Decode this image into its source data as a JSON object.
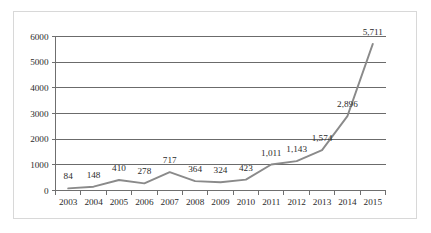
{
  "chart_data": {
    "type": "line",
    "title": "",
    "subtitle": "",
    "xlabel": "",
    "ylabel": "",
    "categories": [
      "2003",
      "2004",
      "2005",
      "2006",
      "2007",
      "2008",
      "2009",
      "2010",
      "2011",
      "2012",
      "2013",
      "2014",
      "2015"
    ],
    "values": [
      84,
      148,
      410,
      278,
      717,
      364,
      324,
      423,
      1011,
      1143,
      1574,
      2896,
      5711
    ],
    "point_labels": [
      "84",
      "148",
      "410",
      "278",
      "717",
      "364",
      "324",
      "423",
      "1,011",
      "1,143",
      "1,574",
      "2,896",
      "5,711"
    ],
    "ylim": [
      0,
      6000
    ],
    "ytick_values": [
      0,
      1000,
      2000,
      3000,
      4000,
      5000,
      6000
    ],
    "ytick_labels": [
      "0",
      "1000",
      "2000",
      "3000",
      "4000",
      "5000",
      "6000"
    ],
    "grid": "horizontal",
    "legend": "none",
    "series": [
      {
        "name": "",
        "values": [
          84,
          148,
          410,
          278,
          717,
          364,
          324,
          423,
          1011,
          1143,
          1574,
          2896,
          5711
        ],
        "color": "#8a8a8a"
      }
    ],
    "colors": {
      "line": "#8a8a8a",
      "axis": "#6f6f6f",
      "grid": "#6b6b6b",
      "text": "#2b2b2b",
      "frame": "#d8d8d8",
      "background": "#ffffff"
    }
  }
}
